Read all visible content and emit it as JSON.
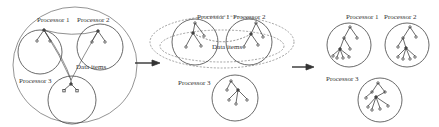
{
  "diagram": {
    "type": "partitioning-stages",
    "stages": [
      {
        "name": "stage-1-shared-data",
        "processors": [
          {
            "label": "Processor 1"
          },
          {
            "label": "Processor 2"
          },
          {
            "label": "Processor 3"
          }
        ],
        "data_label": "Data items"
      },
      {
        "name": "stage-2-partial-share",
        "processors": [
          {
            "label": "Processor 1"
          },
          {
            "label": "Processor 2"
          },
          {
            "label": "Processor 3"
          }
        ],
        "data_label": "Data items"
      },
      {
        "name": "stage-3-independent",
        "processors": [
          {
            "label": "Processor 1"
          },
          {
            "label": "Processor 2"
          },
          {
            "label": "Processor 3"
          }
        ]
      }
    ],
    "arrows": [
      {
        "from": "stage-1-shared-data",
        "to": "stage-2-partial-share"
      },
      {
        "from": "stage-2-partial-share",
        "to": "stage-3-independent"
      }
    ],
    "colors": {
      "stroke": "#444444",
      "text": "#333333",
      "background": "#ffffff"
    }
  }
}
